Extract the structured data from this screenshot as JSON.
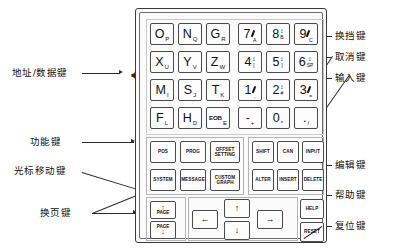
{
  "diagram": {
    "panel_name": "mdi-keypad-panel"
  },
  "annotations": {
    "left": [
      {
        "id": "address-data-keys",
        "text": "地址/数据键"
      },
      {
        "id": "function-keys",
        "text": "功能键"
      },
      {
        "id": "cursor-move-keys",
        "text": "光标移动键"
      },
      {
        "id": "page-change-keys",
        "text": "换页键"
      }
    ],
    "right": [
      {
        "id": "shift-key",
        "text": "换挡键"
      },
      {
        "id": "cancel-key",
        "text": "取消键"
      },
      {
        "id": "input-key",
        "text": "输入键"
      },
      {
        "id": "edit-key",
        "text": "编辑键"
      },
      {
        "id": "help-key",
        "text": "帮助键"
      },
      {
        "id": "reset-key",
        "text": "复位键"
      }
    ]
  },
  "keypad": {
    "address_rows": [
      [
        {
          "main": "O",
          "sub": "P"
        },
        {
          "main": "N",
          "sub": "Q"
        },
        {
          "main": "G",
          "sub": "R"
        },
        {
          "main": "7",
          "sub": "A",
          "mark": "tick"
        },
        {
          "main": "8",
          "sub": "B",
          "mark": "updown"
        },
        {
          "main": "9",
          "sub": "C",
          "mark": "tick"
        }
      ],
      [
        {
          "main": "X",
          "sub": "U"
        },
        {
          "main": "Y",
          "sub": "V"
        },
        {
          "main": "Z",
          "sub": "W"
        },
        {
          "main": "4",
          "sub": "[",
          "mark": "updown"
        },
        {
          "main": "5",
          "sub": "]",
          "mark": "updown"
        },
        {
          "main": "6",
          "sub": "SP",
          "mark": "updown"
        }
      ],
      [
        {
          "main": "M",
          "sub": "I"
        },
        {
          "main": "S",
          "sub": "J"
        },
        {
          "main": "T",
          "sub": "K"
        },
        {
          "main": "1",
          "sub": ",",
          "mark": "tick"
        },
        {
          "main": "2",
          "sub": "#",
          "mark": "updown"
        },
        {
          "main": "3",
          "sub": "=",
          "mark": "tick"
        }
      ],
      [
        {
          "main": "F",
          "sub": "L"
        },
        {
          "main": "H",
          "sub": "D"
        },
        {
          "main": "EOB",
          "sub": "E"
        },
        {
          "main": "-",
          "sub": "+"
        },
        {
          "main": "0",
          "sub": "*"
        },
        {
          "main": ".",
          "sub": "/"
        }
      ]
    ],
    "function_keys": [
      {
        "id": "pos",
        "lines": [
          "POS"
        ]
      },
      {
        "id": "prog",
        "lines": [
          "PROG"
        ]
      },
      {
        "id": "offset-setting",
        "lines": [
          "OFFSET",
          "SETTING"
        ]
      },
      {
        "id": "system",
        "lines": [
          "SYSTEM"
        ]
      },
      {
        "id": "message",
        "lines": [
          "MESSAGE"
        ]
      },
      {
        "id": "custom-graph",
        "lines": [
          "CUSTOM",
          "GRAPH"
        ]
      }
    ],
    "edit_keys": [
      {
        "id": "shift",
        "lines": [
          "SHIFT"
        ]
      },
      {
        "id": "can",
        "lines": [
          "CAN"
        ]
      },
      {
        "id": "input",
        "lines": [
          "INPUT"
        ]
      },
      {
        "id": "alter",
        "lines": [
          "ALTER"
        ]
      },
      {
        "id": "insert",
        "lines": [
          "INSERT"
        ]
      },
      {
        "id": "delete",
        "lines": [
          "DELETE"
        ]
      }
    ],
    "page_keys": [
      {
        "id": "page-up",
        "label": "PAGE",
        "arrow": "↑"
      },
      {
        "id": "page-down",
        "label": "PAGE",
        "arrow": "↓"
      }
    ],
    "cursor_keys": [
      {
        "id": "cursor-left",
        "arrow": "←"
      },
      {
        "id": "cursor-up",
        "arrow": "↑"
      },
      {
        "id": "cursor-down",
        "arrow": "↓"
      },
      {
        "id": "cursor-right",
        "arrow": "→"
      }
    ],
    "side_keys": [
      {
        "id": "help",
        "lines": [
          "HELP"
        ]
      },
      {
        "id": "reset",
        "lines": [
          "RESET"
        ]
      }
    ]
  },
  "colors": {
    "ink": "#111111",
    "line": "#2b2b2b",
    "panel_border": "#3a3a3a",
    "key_border": "#4a4a4a",
    "group_border": "#b4b4b4",
    "background": "#ffffff"
  }
}
